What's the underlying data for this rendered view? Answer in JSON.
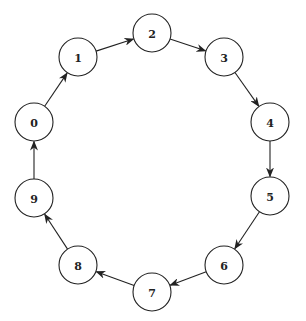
{
  "diagram": {
    "type": "directed-cycle-graph",
    "node_radius": 19,
    "colors": {
      "stroke": "#222222",
      "fill": "#ffffff",
      "background": "#ffffff"
    },
    "nodes": [
      {
        "id": "0",
        "label": "0",
        "x": 34,
        "y": 122
      },
      {
        "id": "1",
        "label": "1",
        "x": 78,
        "y": 57
      },
      {
        "id": "2",
        "label": "2",
        "x": 152,
        "y": 33
      },
      {
        "id": "3",
        "label": "3",
        "x": 224,
        "y": 57
      },
      {
        "id": "4",
        "label": "4",
        "x": 270,
        "y": 122
      },
      {
        "id": "5",
        "label": "5",
        "x": 270,
        "y": 196
      },
      {
        "id": "6",
        "label": "6",
        "x": 224,
        "y": 265
      },
      {
        "id": "7",
        "label": "7",
        "x": 152,
        "y": 292
      },
      {
        "id": "8",
        "label": "8",
        "x": 78,
        "y": 265
      },
      {
        "id": "9",
        "label": "9",
        "x": 34,
        "y": 198
      }
    ],
    "edges": [
      {
        "from": "0",
        "to": "1"
      },
      {
        "from": "1",
        "to": "2"
      },
      {
        "from": "2",
        "to": "3"
      },
      {
        "from": "3",
        "to": "4"
      },
      {
        "from": "4",
        "to": "5"
      },
      {
        "from": "5",
        "to": "6"
      },
      {
        "from": "6",
        "to": "7"
      },
      {
        "from": "7",
        "to": "8"
      },
      {
        "from": "8",
        "to": "9"
      },
      {
        "from": "9",
        "to": "0"
      }
    ]
  }
}
